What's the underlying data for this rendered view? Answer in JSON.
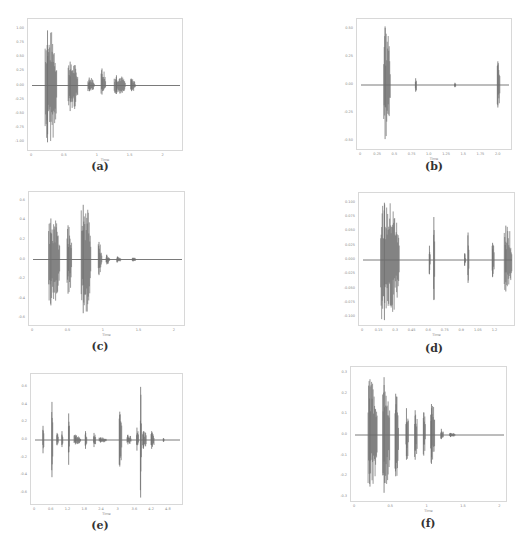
{
  "figure": {
    "panels": [
      {
        "id": "a",
        "caption": "(a)",
        "frame": {
          "x": 27,
          "y": 18,
          "w": 156,
          "h": 133
        },
        "caption_pos": {
          "x": 80,
          "y": 160
        },
        "xlabel": "Time",
        "xlim": [
          0,
          2.25
        ],
        "ylim": [
          -1.1,
          1.1
        ],
        "xticks": [
          "0",
          "0.5",
          "1",
          "1.5",
          "2"
        ],
        "xtick_values": [
          0,
          0.5,
          1,
          1.5,
          2
        ],
        "yticks": [
          "1.00",
          "0.75",
          "0.50",
          "0.25",
          "0.00",
          "-0.25",
          "-0.50",
          "-0.75",
          "-1.00"
        ],
        "ytick_values": [
          1.0,
          0.75,
          0.5,
          0.25,
          0.0,
          -0.25,
          -0.5,
          -0.75,
          -1.0
        ]
      },
      {
        "id": "b",
        "caption": "(b)",
        "frame": {
          "x": 356,
          "y": 18,
          "w": 156,
          "h": 132
        },
        "caption_pos": {
          "x": 414,
          "y": 160
        },
        "xlabel": "Time",
        "xlim": [
          0,
          2.15
        ],
        "ylim": [
          -0.55,
          0.55
        ],
        "xticks": [
          "0",
          "0.25",
          "0.5",
          "0.75",
          "1.0",
          "1.25",
          "1.5",
          "1.75",
          "2.0"
        ],
        "xtick_values": [
          0,
          0.25,
          0.5,
          0.75,
          1.0,
          1.25,
          1.5,
          1.75,
          2.0
        ],
        "yticks": [
          "0.50",
          "0.25",
          "0.00",
          "-0.25",
          "-0.50"
        ],
        "ytick_values": [
          0.5,
          0.25,
          0.0,
          -0.25,
          -0.5
        ]
      },
      {
        "id": "c",
        "caption": "(c)",
        "frame": {
          "x": 28,
          "y": 191,
          "w": 157,
          "h": 135
        },
        "caption_pos": {
          "x": 80,
          "y": 340
        },
        "xlabel": "Time",
        "xlim": [
          0,
          2.1
        ],
        "ylim": [
          -0.65,
          0.65
        ],
        "xticks": [
          "0",
          "0.5",
          "1",
          "1.5",
          "2"
        ],
        "xtick_values": [
          0,
          0.5,
          1,
          1.5,
          2
        ],
        "yticks": [
          "0.6",
          "0.4",
          "0.2",
          "0.0",
          "-0.2",
          "-0.4",
          "-0.6"
        ],
        "ytick_values": [
          0.6,
          0.4,
          0.2,
          0.0,
          -0.2,
          -0.4,
          -0.6
        ]
      },
      {
        "id": "d",
        "caption": "(d)",
        "frame": {
          "x": 358,
          "y": 192,
          "w": 157,
          "h": 134
        },
        "caption_pos": {
          "x": 414,
          "y": 342
        },
        "xlabel": "Time",
        "xlim": [
          0,
          1.35
        ],
        "ylim": [
          -0.11,
          0.11
        ],
        "xticks": [
          "0",
          "0.15",
          "0.3",
          "0.45",
          "0.6",
          "0.75",
          "0.9",
          "1.05",
          "1.2"
        ],
        "xtick_values": [
          0,
          0.15,
          0.3,
          0.45,
          0.6,
          0.75,
          0.9,
          1.05,
          1.2
        ],
        "yticks": [
          "0.100",
          "0.075",
          "0.050",
          "0.025",
          "0.000",
          "-0.025",
          "-0.050",
          "-0.075",
          "-0.100"
        ],
        "ytick_values": [
          0.1,
          0.075,
          0.05,
          0.025,
          0.0,
          -0.025,
          -0.05,
          -0.075,
          -0.1
        ]
      },
      {
        "id": "e",
        "caption": "(e)",
        "frame": {
          "x": 30,
          "y": 373,
          "w": 153,
          "h": 132
        },
        "caption_pos": {
          "x": 80,
          "y": 519
        },
        "xlabel": "Time",
        "xlim": [
          0,
          5.2
        ],
        "ylim": [
          -0.7,
          0.7
        ],
        "xticks": [
          "0",
          "0.6",
          "1.2",
          "1.8",
          "2.4",
          "3",
          "3.6",
          "4.2",
          "4.8"
        ],
        "xtick_values": [
          0,
          0.6,
          1.2,
          1.8,
          2.4,
          3.0,
          3.6,
          4.2,
          4.8
        ],
        "yticks": [
          "0.6",
          "0.4",
          "0.2",
          "0.0",
          "-0.2",
          "-0.4",
          "-0.6"
        ],
        "ytick_values": [
          0.6,
          0.4,
          0.2,
          0.0,
          -0.2,
          -0.4,
          -0.6
        ]
      },
      {
        "id": "f",
        "caption": "(f)",
        "frame": {
          "x": 350,
          "y": 366,
          "w": 157,
          "h": 136
        },
        "caption_pos": {
          "x": 408,
          "y": 517
        },
        "xlabel": "Time",
        "xlim": [
          0,
          2.05
        ],
        "ylim": [
          -0.31,
          0.31
        ],
        "xticks": [
          "0",
          "0.5",
          "1",
          "1.5",
          "2"
        ],
        "xtick_values": [
          0,
          0.5,
          1,
          1.5,
          2
        ],
        "yticks": [
          "0.3",
          "0.2",
          "0.1",
          "0.0",
          "-0.1",
          "-0.2",
          "-0.3"
        ],
        "ytick_values": [
          0.3,
          0.2,
          0.1,
          0.0,
          -0.1,
          -0.2,
          -0.3
        ]
      }
    ]
  },
  "chart_data": [
    {
      "type": "area",
      "title": "(a)",
      "xlabel": "Time",
      "ylabel": "",
      "xlim": [
        0,
        2.25
      ],
      "ylim": [
        -1.1,
        1.1
      ],
      "grid": false,
      "series": [
        {
          "name": "waveform",
          "color": "#6e6e6e",
          "segments": [
            {
              "start": 0.2,
              "end": 0.38,
              "peak_pos": 0.97,
              "peak_neg": -1.0
            },
            {
              "start": 0.55,
              "end": 0.7,
              "peak_pos": 0.42,
              "peak_neg": -0.45
            },
            {
              "start": 0.85,
              "end": 0.95,
              "peak_pos": 0.14,
              "peak_neg": -0.1
            },
            {
              "start": 1.05,
              "end": 1.12,
              "peak_pos": 0.3,
              "peak_neg": -0.16
            },
            {
              "start": 1.25,
              "end": 1.42,
              "peak_pos": 0.18,
              "peak_neg": -0.15
            },
            {
              "start": 1.5,
              "end": 1.57,
              "peak_pos": 0.12,
              "peak_neg": -0.1
            }
          ]
        }
      ]
    },
    {
      "type": "area",
      "title": "(b)",
      "xlabel": "Time",
      "ylabel": "",
      "xlim": [
        0,
        2.15
      ],
      "ylim": [
        -0.55,
        0.55
      ],
      "grid": false,
      "series": [
        {
          "name": "waveform",
          "color": "#6e6e6e",
          "segments": [
            {
              "start": 0.33,
              "end": 0.43,
              "peak_pos": 0.52,
              "peak_neg": -0.48
            },
            {
              "start": 0.79,
              "end": 0.81,
              "peak_pos": 0.06,
              "peak_neg": -0.06
            },
            {
              "start": 1.36,
              "end": 1.38,
              "peak_pos": 0.02,
              "peak_neg": -0.02
            },
            {
              "start": 1.98,
              "end": 2.02,
              "peak_pos": 0.21,
              "peak_neg": -0.2
            }
          ]
        }
      ]
    },
    {
      "type": "area",
      "title": "(c)",
      "xlabel": "Time",
      "ylabel": "",
      "xlim": [
        0,
        2.1
      ],
      "ylim": [
        -0.65,
        0.65
      ],
      "grid": false,
      "series": [
        {
          "name": "waveform",
          "color": "#6e6e6e",
          "segments": [
            {
              "start": 0.22,
              "end": 0.38,
              "peak_pos": 0.42,
              "peak_neg": -0.47
            },
            {
              "start": 0.48,
              "end": 0.55,
              "peak_pos": 0.35,
              "peak_neg": -0.35
            },
            {
              "start": 0.68,
              "end": 0.82,
              "peak_pos": 0.56,
              "peak_neg": -0.55
            },
            {
              "start": 0.92,
              "end": 0.97,
              "peak_pos": 0.18,
              "peak_neg": -0.16
            },
            {
              "start": 1.03,
              "end": 1.08,
              "peak_pos": 0.05,
              "peak_neg": -0.05
            },
            {
              "start": 1.18,
              "end": 1.24,
              "peak_pos": 0.03,
              "peak_neg": -0.03
            },
            {
              "start": 1.4,
              "end": 1.45,
              "peak_pos": 0.02,
              "peak_neg": -0.02
            }
          ]
        }
      ]
    },
    {
      "type": "area",
      "title": "(d)",
      "xlabel": "Time",
      "ylabel": "",
      "xlim": [
        0,
        1.35
      ],
      "ylim": [
        -0.11,
        0.11
      ],
      "grid": false,
      "series": [
        {
          "name": "waveform",
          "color": "#6e6e6e",
          "segments": [
            {
              "start": 0.16,
              "end": 0.33,
              "peak_pos": 0.1,
              "peak_neg": -0.105
            },
            {
              "start": 0.6,
              "end": 0.61,
              "peak_pos": 0.025,
              "peak_neg": -0.025
            },
            {
              "start": 0.64,
              "end": 0.65,
              "peak_pos": 0.075,
              "peak_neg": -0.07
            },
            {
              "start": 0.92,
              "end": 0.93,
              "peak_pos": 0.012,
              "peak_neg": -0.01
            },
            {
              "start": 0.95,
              "end": 0.96,
              "peak_pos": 0.048,
              "peak_neg": -0.04
            },
            {
              "start": 1.17,
              "end": 1.19,
              "peak_pos": 0.03,
              "peak_neg": -0.03
            },
            {
              "start": 1.28,
              "end": 1.35,
              "peak_pos": 0.06,
              "peak_neg": -0.055
            }
          ]
        }
      ]
    },
    {
      "type": "area",
      "title": "(e)",
      "xlabel": "Time",
      "ylabel": "",
      "xlim": [
        0,
        5.2
      ],
      "ylim": [
        -0.7,
        0.7
      ],
      "grid": false,
      "series": [
        {
          "name": "waveform",
          "color": "#6e6e6e",
          "segments": [
            {
              "start": 0.28,
              "end": 0.32,
              "peak_pos": 0.16,
              "peak_neg": -0.15
            },
            {
              "start": 0.6,
              "end": 0.64,
              "peak_pos": 0.43,
              "peak_neg": -0.42
            },
            {
              "start": 0.78,
              "end": 0.84,
              "peak_pos": 0.08,
              "peak_neg": -0.06
            },
            {
              "start": 0.96,
              "end": 1.0,
              "peak_pos": 0.1,
              "peak_neg": -0.08
            },
            {
              "start": 1.2,
              "end": 1.24,
              "peak_pos": 0.3,
              "peak_neg": -0.28
            },
            {
              "start": 1.4,
              "end": 1.64,
              "peak_pos": 0.06,
              "peak_neg": -0.05
            },
            {
              "start": 1.8,
              "end": 1.86,
              "peak_pos": 0.1,
              "peak_neg": -0.1
            },
            {
              "start": 2.1,
              "end": 2.18,
              "peak_pos": 0.08,
              "peak_neg": -0.08
            },
            {
              "start": 2.3,
              "end": 2.56,
              "peak_pos": 0.03,
              "peak_neg": -0.03
            },
            {
              "start": 3.02,
              "end": 3.12,
              "peak_pos": 0.32,
              "peak_neg": -0.3
            },
            {
              "start": 3.3,
              "end": 3.46,
              "peak_pos": 0.06,
              "peak_neg": -0.05
            },
            {
              "start": 3.64,
              "end": 3.72,
              "peak_pos": 0.14,
              "peak_neg": -0.12
            },
            {
              "start": 3.78,
              "end": 3.82,
              "peak_pos": 0.6,
              "peak_neg": -0.65
            },
            {
              "start": 3.86,
              "end": 4.0,
              "peak_pos": 0.1,
              "peak_neg": -0.1
            },
            {
              "start": 4.16,
              "end": 4.28,
              "peak_pos": 0.1,
              "peak_neg": -0.1
            },
            {
              "start": 4.6,
              "end": 4.62,
              "peak_pos": 0.02,
              "peak_neg": -0.02
            }
          ]
        }
      ]
    },
    {
      "type": "area",
      "title": "(f)",
      "xlabel": "Time",
      "ylabel": "",
      "xlim": [
        0,
        2.05
      ],
      "ylim": [
        -0.31,
        0.31
      ],
      "grid": false,
      "series": [
        {
          "name": "waveform",
          "color": "#6e6e6e",
          "segments": [
            {
              "start": 0.18,
              "end": 0.31,
              "peak_pos": 0.27,
              "peak_neg": -0.25
            },
            {
              "start": 0.38,
              "end": 0.48,
              "peak_pos": 0.28,
              "peak_neg": -0.28
            },
            {
              "start": 0.55,
              "end": 0.6,
              "peak_pos": 0.2,
              "peak_neg": -0.2
            },
            {
              "start": 0.7,
              "end": 0.74,
              "peak_pos": 0.13,
              "peak_neg": -0.12
            },
            {
              "start": 0.82,
              "end": 0.86,
              "peak_pos": 0.12,
              "peak_neg": -0.12
            },
            {
              "start": 0.94,
              "end": 0.97,
              "peak_pos": 0.11,
              "peak_neg": -0.1
            },
            {
              "start": 1.04,
              "end": 1.1,
              "peak_pos": 0.15,
              "peak_neg": -0.14
            },
            {
              "start": 1.18,
              "end": 1.22,
              "peak_pos": 0.03,
              "peak_neg": -0.02
            },
            {
              "start": 1.3,
              "end": 1.38,
              "peak_pos": 0.01,
              "peak_neg": -0.01
            }
          ]
        }
      ]
    }
  ]
}
